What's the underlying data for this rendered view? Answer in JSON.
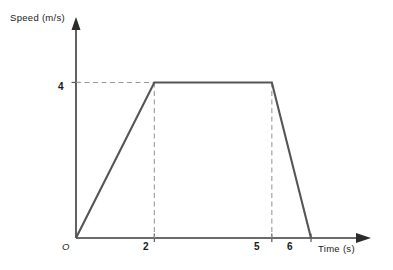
{
  "chart_data": {
    "type": "line",
    "title": "",
    "xlabel": "Time (s)",
    "ylabel": "Speed (m/s)",
    "origin_label": "O",
    "x": [
      0,
      2,
      5,
      6
    ],
    "values": [
      0,
      4,
      4,
      0
    ],
    "series": [
      {
        "name": "Speed",
        "points": [
          {
            "x": 0,
            "y": 0
          },
          {
            "x": 2,
            "y": 4
          },
          {
            "x": 5,
            "y": 4
          },
          {
            "x": 6,
            "y": 0
          }
        ]
      }
    ],
    "xticks": [
      2,
      5,
      6
    ],
    "xtick_labels": [
      "2",
      "5",
      "6"
    ],
    "yticks": [
      4
    ],
    "ytick_labels": [
      "4"
    ],
    "xlim": [
      0,
      7.2
    ],
    "ylim": [
      0,
      5.4
    ],
    "grid": false,
    "legend": false,
    "guides": {
      "horizontal": [
        4
      ],
      "vertical": [
        2,
        5
      ]
    },
    "colors": {
      "line": "#555555",
      "axis": "#3a3a3a",
      "guide": "#9a9a9a",
      "background": "#ffffff",
      "text": "#1a1a1a"
    }
  }
}
